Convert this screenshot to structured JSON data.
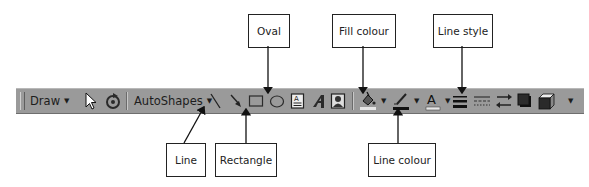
{
  "toolbar": {
    "draw_label": "Draw",
    "autoshapes_label": "AutoShapes",
    "icons": [
      "select-pointer-icon",
      "free-rotate-icon",
      "line-icon",
      "arrow-icon",
      "rectangle-icon",
      "oval-icon",
      "text-box-icon",
      "wordart-icon",
      "clip-art-icon",
      "fill-colour-icon",
      "line-colour-icon",
      "font-colour-icon",
      "line-style-icon",
      "dash-style-icon",
      "arrow-style-icon",
      "shadow-icon",
      "3d-icon"
    ],
    "background": "#9a9a9a"
  },
  "callouts": {
    "oval": "Oval",
    "fill_colour": "Fill colour",
    "line_style": "Line style",
    "line": "Line",
    "rectangle": "Rectangle",
    "line_colour": "Line colour"
  }
}
